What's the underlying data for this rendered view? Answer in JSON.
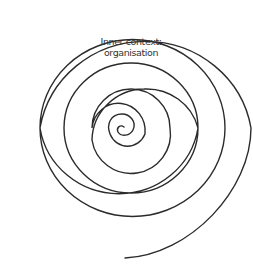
{
  "diagram": {
    "type": "spiral",
    "label": {
      "line1": "Inner context:",
      "line2": "organisation"
    },
    "stroke_color": "#2b2b2b",
    "text_color": "#333333",
    "background": "#ffffff"
  }
}
